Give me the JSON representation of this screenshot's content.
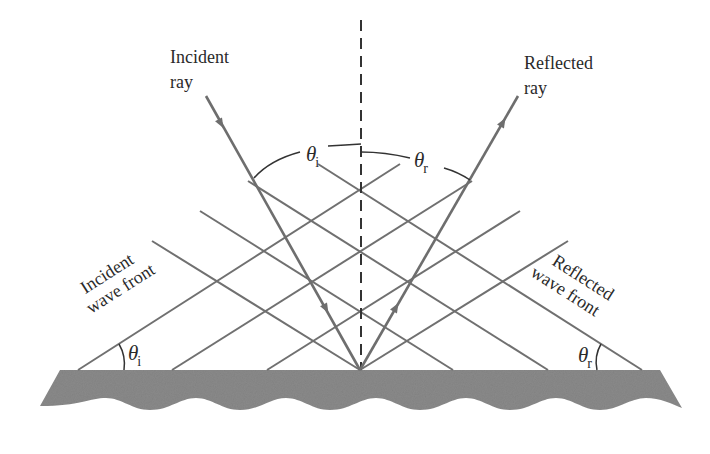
{
  "figure": {
    "colors": {
      "ray": "#6e6e6e",
      "wavefront": "#707070",
      "normal": "#333333",
      "surface": "#8a8a8a",
      "text": "#2a2a2a"
    }
  },
  "labels": {
    "incident_ray": [
      "Incident",
      "ray"
    ],
    "reflected_ray": [
      "Reflected",
      "ray"
    ],
    "incident_wave_front": [
      "Incident",
      "wave front"
    ],
    "reflected_wave_front": [
      "Reflected",
      "wave front"
    ]
  },
  "angles": {
    "theta_symbol": "θ",
    "incident_subscript": "i",
    "reflected_subscript": "r"
  },
  "geometry": {
    "reflection_point": [
      360,
      370
    ],
    "surface_top_y": 370,
    "incident_ray_start": [
      206,
      96
    ],
    "reflected_ray_end": [
      518,
      96
    ],
    "incident_wavefronts_surface_x": [
      78,
      172,
      267,
      360
    ],
    "reflected_wavefronts_surface_x": [
      360,
      453,
      548,
      642
    ]
  }
}
